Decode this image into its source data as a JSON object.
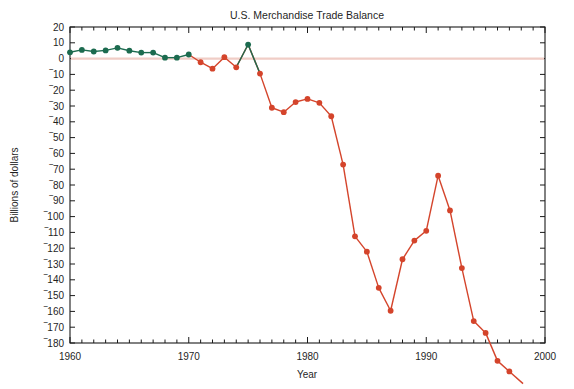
{
  "chart_data": {
    "type": "line",
    "title": "U.S. Merchandise Trade Balance",
    "xlabel": "Year",
    "ylabel": "Billions of dollars",
    "xlim": [
      1960,
      2000
    ],
    "ylim": [
      -180,
      20
    ],
    "grid": false,
    "legend": null,
    "y_tick_labels": [
      "20",
      "10",
      "0",
      "‾10",
      "‾20",
      "‾30",
      "‾40",
      "‾50",
      "‾60",
      "‾70",
      "‾80",
      "‾90",
      "‾100",
      "‾110",
      "‾120",
      "‾130",
      "‾140",
      "‾150",
      "‾160",
      "‾170",
      "‾180"
    ],
    "y_tick_values": [
      20,
      10,
      0,
      -10,
      -20,
      -30,
      -40,
      -50,
      -60,
      -70,
      -80,
      -90,
      -100,
      -110,
      -120,
      -130,
      -140,
      -150,
      -160,
      -170,
      -180
    ],
    "x_tick_labels": [
      "1960",
      "1970",
      "1980",
      "1990",
      "2000"
    ],
    "x_tick_values": [
      1960,
      1970,
      1980,
      1990,
      2000
    ],
    "x_minor_step": 1,
    "zero_reference_line": 0,
    "colors": {
      "positive": "#1c6b4f",
      "negative": "#d4442b",
      "zero_line": "#f0cdc6",
      "axis": "#1a1a1a",
      "text": "#1f1f1f",
      "background": "#ffffff"
    },
    "x": [
      1960,
      1961,
      1962,
      1963,
      1964,
      1965,
      1966,
      1967,
      1968,
      1969,
      1970,
      1971,
      1972,
      1973,
      1974,
      1975,
      1976,
      1977,
      1978,
      1979,
      1980,
      1981,
      1982,
      1983,
      1984,
      1985,
      1986,
      1987,
      1988,
      1989,
      1990,
      1991,
      1992,
      1993,
      1994,
      1995,
      1996,
      1997
    ],
    "values": [
      4.0,
      5.5,
      4.5,
      5.2,
      6.8,
      5.0,
      3.8,
      3.8,
      0.6,
      0.6,
      2.6,
      -2.3,
      -6.4,
      0.9,
      -5.5,
      8.9,
      -9.5,
      -31.1,
      -33.9,
      -27.5,
      -25.5,
      -28.0,
      -36.5,
      -67.1,
      -112.5,
      -122.2,
      -145.1,
      -159.6,
      -127.0,
      -115.2,
      -109.0,
      -74.1,
      -96.1,
      -132.6,
      -166.1,
      -173.6,
      -191.3,
      -198.0
    ],
    "series": [
      {
        "name": "U.S. Merchandise Trade Balance",
        "unit": "Billions of dollars",
        "points": [
          {
            "year": 1960,
            "value": 4.0,
            "sign": "positive"
          },
          {
            "year": 1961,
            "value": 5.5,
            "sign": "positive"
          },
          {
            "year": 1962,
            "value": 4.5,
            "sign": "positive"
          },
          {
            "year": 1963,
            "value": 5.2,
            "sign": "positive"
          },
          {
            "year": 1964,
            "value": 6.8,
            "sign": "positive"
          },
          {
            "year": 1965,
            "value": 5.0,
            "sign": "positive"
          },
          {
            "year": 1966,
            "value": 3.8,
            "sign": "positive"
          },
          {
            "year": 1967,
            "value": 3.8,
            "sign": "positive"
          },
          {
            "year": 1968,
            "value": 0.6,
            "sign": "positive"
          },
          {
            "year": 1969,
            "value": 0.6,
            "sign": "positive"
          },
          {
            "year": 1970,
            "value": 2.6,
            "sign": "positive"
          },
          {
            "year": 1971,
            "value": -2.3,
            "sign": "negative"
          },
          {
            "year": 1972,
            "value": -6.4,
            "sign": "negative"
          },
          {
            "year": 1973,
            "value": 0.9,
            "sign": "negative"
          },
          {
            "year": 1974,
            "value": -5.5,
            "sign": "negative"
          },
          {
            "year": 1975,
            "value": 8.9,
            "sign": "positive"
          },
          {
            "year": 1976,
            "value": -9.5,
            "sign": "negative"
          },
          {
            "year": 1977,
            "value": -31.1,
            "sign": "negative"
          },
          {
            "year": 1978,
            "value": -33.9,
            "sign": "negative"
          },
          {
            "year": 1979,
            "value": -27.5,
            "sign": "negative"
          },
          {
            "year": 1980,
            "value": -25.5,
            "sign": "negative"
          },
          {
            "year": 1981,
            "value": -28.0,
            "sign": "negative"
          },
          {
            "year": 1982,
            "value": -36.5,
            "sign": "negative"
          },
          {
            "year": 1983,
            "value": -67.1,
            "sign": "negative"
          },
          {
            "year": 1984,
            "value": -112.5,
            "sign": "negative"
          },
          {
            "year": 1985,
            "value": -122.2,
            "sign": "negative"
          },
          {
            "year": 1986,
            "value": -145.1,
            "sign": "negative"
          },
          {
            "year": 1987,
            "value": -159.6,
            "sign": "negative"
          },
          {
            "year": 1988,
            "value": -127.0,
            "sign": "negative"
          },
          {
            "year": 1989,
            "value": -115.2,
            "sign": "negative"
          },
          {
            "year": 1990,
            "value": -109.0,
            "sign": "negative"
          },
          {
            "year": 1991,
            "value": -74.1,
            "sign": "negative"
          },
          {
            "year": 1992,
            "value": -96.1,
            "sign": "negative"
          },
          {
            "year": 1993,
            "value": -132.6,
            "sign": "negative"
          },
          {
            "year": 1994,
            "value": -166.1,
            "sign": "negative"
          },
          {
            "year": 1995,
            "value": -173.6,
            "sign": "negative"
          },
          {
            "year": 1996,
            "value": -191.3,
            "sign": "negative"
          },
          {
            "year": 1997,
            "value": -198.0,
            "sign": "negative"
          }
        ]
      }
    ]
  }
}
